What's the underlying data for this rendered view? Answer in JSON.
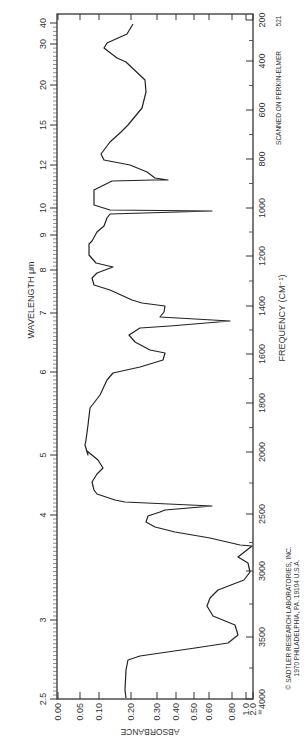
{
  "chart_data": {
    "type": "line",
    "title": "",
    "orientation": "rotated-90",
    "xlabel": "FREQUENCY (CM⁻¹)",
    "x2label": "WAVELENGTH μm",
    "ylabel": "ABSORBANCE",
    "frequency_ticks": [
      {
        "label": "200",
        "pos": 20
      },
      {
        "label": "400",
        "pos": 61
      },
      {
        "label": "600",
        "pos": 110
      },
      {
        "label": "800",
        "pos": 159
      },
      {
        "label": "1000",
        "pos": 208
      },
      {
        "label": "1200",
        "pos": 256
      },
      {
        "label": "1400",
        "pos": 306
      },
      {
        "label": "1600",
        "pos": 354
      },
      {
        "label": "1800",
        "pos": 403
      },
      {
        "label": "2000",
        "pos": 452
      },
      {
        "label": "2500",
        "pos": 514
      },
      {
        "label": "3000",
        "pos": 571
      },
      {
        "label": "3500",
        "pos": 637
      },
      {
        "label": "4000",
        "pos": 699
      }
    ],
    "wavelength_ticks": [
      {
        "label": "40",
        "pos": 23
      },
      {
        "label": "30",
        "pos": 44
      },
      {
        "label": "20",
        "pos": 85
      },
      {
        "label": "15",
        "pos": 125
      },
      {
        "label": "12",
        "pos": 165
      },
      {
        "label": "10",
        "pos": 208
      },
      {
        "label": "9",
        "pos": 235
      },
      {
        "label": "8",
        "pos": 270
      },
      {
        "label": "7",
        "pos": 313
      },
      {
        "label": "6",
        "pos": 372
      },
      {
        "label": "5",
        "pos": 455
      },
      {
        "label": "4",
        "pos": 515
      },
      {
        "label": "3",
        "pos": 620
      },
      {
        "label": "2.5",
        "pos": 699
      }
    ],
    "absorbance_ticks": [
      {
        "label": "0.00",
        "pos": 58
      },
      {
        "label": "0.05",
        "pos": 80
      },
      {
        "label": "0.10",
        "pos": 99
      },
      {
        "label": "0.20",
        "pos": 131
      },
      {
        "label": "0.30",
        "pos": 157
      },
      {
        "label": "0.40",
        "pos": 176
      },
      {
        "label": "0.50",
        "pos": 194
      },
      {
        "label": "0.60",
        "pos": 209
      },
      {
        "label": "0.80",
        "pos": 232
      },
      {
        "label": "1.0",
        "pos": 246
      },
      {
        "label": "2.0",
        "pos": 253
      }
    ],
    "infinity_label": "∞",
    "series": [
      {
        "name": "IR absorbance spectrum",
        "frequency_cm-1": [
          200,
          300,
          400,
          450,
          550,
          600,
          700,
          780,
          850,
          880,
          885,
          900,
          920,
          960,
          990,
          1005,
          1015,
          1040,
          1080,
          1100,
          1150,
          1180,
          1200,
          1230,
          1260,
          1280,
          1330,
          1380,
          1400,
          1420,
          1440,
          1465,
          1490,
          1530,
          1570,
          1600,
          1615,
          1640,
          1670,
          1700,
          1750,
          1800,
          1880,
          1980,
          2000,
          2050,
          2120,
          2200,
          2280,
          2350,
          2420,
          2450,
          2480,
          2500,
          2550,
          2620,
          2700,
          2780,
          2820,
          2870,
          2950,
          3000,
          3050,
          3100,
          3150,
          3250,
          3330,
          3450,
          3600,
          3700,
          3800,
          4000
        ],
        "absorbance": [
          0.18,
          0.14,
          0.09,
          0.08,
          0.11,
          0.14,
          0.21,
          0.22,
          0.19,
          0.14,
          0.11,
          0.12,
          0.17,
          0.28,
          0.3,
          0.34,
          0.3,
          0.2,
          0.11,
          0.11,
          1.0,
          0.12,
          0.12,
          0.11,
          0.09,
          0.08,
          0.08,
          0.12,
          0.2,
          0.12,
          0.09,
          0.09,
          0.13,
          0.21,
          0.25,
          0.31,
          0.3,
          0.95,
          0.31,
          0.21,
          0.16,
          0.2,
          0.31,
          0.28,
          0.17,
          0.13,
          0.13,
          0.11,
          0.08,
          0.07,
          0.07,
          0.07,
          0.08,
          0.1,
          0.11,
          0.09,
          0.08,
          0.12,
          0.14,
          1.0,
          0.32,
          0.3,
          0.25,
          0.24,
          0.28,
          0.39,
          0.58,
          2.0,
          1.4,
          2.0,
          1.5,
          0.75,
          0.62,
          0.6,
          0.67,
          0.96,
          1.1,
          0.83,
          0.32,
          0.2,
          0.18,
          0.18,
          0.18
        ],
        "approx_pixels": [
          [
            133,
            24
          ],
          [
            127,
            34
          ],
          [
            107,
            43
          ],
          [
            104,
            48
          ],
          [
            117,
            58
          ],
          [
            126,
            62
          ],
          [
            145,
            80
          ],
          [
            146,
            92
          ],
          [
            142,
            108
          ],
          [
            128,
            125
          ],
          [
            121,
            132
          ],
          [
            110,
            142
          ],
          [
            101,
            154
          ],
          [
            104,
            160
          ],
          [
            130,
            165
          ],
          [
            147,
            172
          ],
          [
            155,
            178
          ],
          [
            168,
            180
          ],
          [
            153,
            180
          ],
          [
            112,
            181
          ],
          [
            94,
            190
          ],
          [
            94,
            205
          ],
          [
            110,
            210
          ],
          [
            212,
            211
          ],
          [
            110,
            214
          ],
          [
            107,
            218
          ],
          [
            104,
            226
          ],
          [
            97,
            232
          ],
          [
            92,
            241
          ],
          [
            89,
            244
          ],
          [
            89,
            255
          ],
          [
            96,
            263
          ],
          [
            113,
            267
          ],
          [
            97,
            273
          ],
          [
            92,
            278
          ],
          [
            94,
            285
          ],
          [
            110,
            290
          ],
          [
            132,
            300
          ],
          [
            142,
            303
          ],
          [
            165,
            306
          ],
          [
            164,
            312
          ],
          [
            160,
            317
          ],
          [
            230,
            321
          ],
          [
            170,
            326
          ],
          [
            140,
            328
          ],
          [
            129,
            335
          ],
          [
            135,
            342
          ],
          [
            150,
            350
          ],
          [
            165,
            353
          ],
          [
            163,
            360
          ],
          [
            140,
            367
          ],
          [
            113,
            373
          ],
          [
            107,
            380
          ],
          [
            100,
            395
          ],
          [
            90,
            408
          ],
          [
            88,
            425
          ],
          [
            86,
            440
          ],
          [
            85,
            445
          ],
          [
            88,
            455
          ],
          [
            87,
            451
          ],
          [
            98,
            460
          ],
          [
            103,
            468
          ],
          [
            97,
            474
          ],
          [
            92,
            482
          ],
          [
            94,
            490
          ],
          [
            97,
            494
          ],
          [
            115,
            500
          ],
          [
            125,
            502
          ],
          [
            212,
            506
          ],
          [
            165,
            510
          ],
          [
            160,
            512
          ],
          [
            148,
            516
          ],
          [
            146,
            522
          ],
          [
            155,
            527
          ],
          [
            175,
            532
          ],
          [
            210,
            538
          ],
          [
            240,
            545
          ],
          [
            252,
            546
          ],
          [
            238,
            557
          ],
          [
            248,
            563
          ],
          [
            250,
            572
          ],
          [
            244,
            580
          ],
          [
            218,
            590
          ],
          [
            210,
            598
          ],
          [
            207,
            606
          ],
          [
            213,
            616
          ],
          [
            235,
            625
          ],
          [
            238,
            635
          ],
          [
            228,
            643
          ],
          [
            195,
            648
          ],
          [
            140,
            656
          ],
          [
            128,
            660
          ],
          [
            126,
            670
          ],
          [
            125,
            690
          ],
          [
            126,
            698
          ]
        ]
      }
    ],
    "grid": false,
    "legend": null
  },
  "annotations": {
    "instrument": "SCANNED ON PERKIN-ELMER",
    "chart_number": "521",
    "copyright_line1": "© SADTLER RESEARCH LABORATORIES, INC.",
    "copyright_line2": "1970 PHILADELPHIA, PA.     19104     U.S.A."
  },
  "colors": {
    "line": "#222222",
    "frame": "#333333",
    "text": "#333333",
    "background": "#ffffff"
  }
}
